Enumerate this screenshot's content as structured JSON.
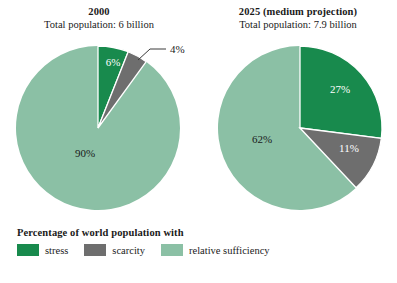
{
  "chart_data": [
    {
      "type": "pie",
      "title": "2000",
      "subtitle": "Total population: 6 billion",
      "categories": [
        "stress",
        "scarcity",
        "relative sufficiency"
      ],
      "values": [
        6,
        4,
        90
      ],
      "labels": [
        "6%",
        "4%",
        "90%"
      ],
      "colors": [
        "#188a4d",
        "#6e6e6e",
        "#8bc0a5"
      ],
      "start_angle_deg": 0,
      "direction": "clockwise",
      "units": "percent",
      "callouts": [
        {
          "label": "4%",
          "series_index": 1
        }
      ],
      "legend_position": "bottom-left",
      "grid": false,
      "xlabel": "",
      "ylabel": ""
    },
    {
      "type": "pie",
      "title": "2025 (medium projection)",
      "subtitle": "Total population: 7.9 billion",
      "categories": [
        "stress",
        "scarcity",
        "relative sufficiency"
      ],
      "values": [
        27,
        11,
        62
      ],
      "labels": [
        "27%",
        "11%",
        "62%"
      ],
      "colors": [
        "#188a4d",
        "#6e6e6e",
        "#8bc0a5"
      ],
      "start_angle_deg": 0,
      "direction": "clockwise",
      "units": "percent",
      "callouts": [],
      "legend_position": "bottom-left",
      "grid": false,
      "xlabel": "",
      "ylabel": ""
    }
  ],
  "panels": {
    "left": {
      "title": "2000",
      "subtitle": "Total population: 6 billion",
      "slice_labels": {
        "stress": "6%",
        "scarcity": "4%",
        "sufficiency": "90%"
      }
    },
    "right": {
      "title": "2025 (medium projection)",
      "subtitle": "Total population: 7.9 billion",
      "slice_labels": {
        "stress": "27%",
        "scarcity": "11%",
        "sufficiency": "62%"
      }
    }
  },
  "legend": {
    "heading": "Percentage of world population with",
    "items": [
      {
        "label": "stress",
        "color": "#188a4d"
      },
      {
        "label": "scarcity",
        "color": "#6e6e6e"
      },
      {
        "label": "relative sufficiency",
        "color": "#8bc0a5"
      }
    ]
  },
  "colors": {
    "stress": "#188a4d",
    "scarcity": "#6e6e6e",
    "sufficiency": "#8bc0a5",
    "background": "#ffffff",
    "text": "#1a1a1a"
  }
}
